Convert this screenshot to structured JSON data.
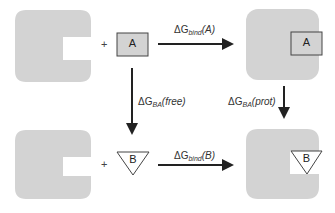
{
  "diagram": {
    "type": "thermodynamic-cycle",
    "nodes": {
      "top_left": {
        "protein": "free protein (with binding pocket)",
        "ligand": "A",
        "ligand_shape": "square"
      },
      "top_right": {
        "complex": "protein bound to A",
        "ligand": "A"
      },
      "bottom_left": {
        "protein": "free protein (with binding pocket)",
        "ligand": "B",
        "ligand_shape": "triangle"
      },
      "bottom_right": {
        "complex": "protein bound to B",
        "ligand": "B"
      }
    },
    "plus_sign": "+",
    "edges": [
      {
        "from": "top_left",
        "to": "top_right",
        "delta": "ΔG",
        "sub": "bind",
        "arg": "(A)"
      },
      {
        "from": "top_left",
        "to": "bottom_left",
        "delta": "ΔG",
        "sub": "BA",
        "arg": "(free)"
      },
      {
        "from": "top_right",
        "to": "bottom_right",
        "delta": "ΔG",
        "sub": "BA",
        "arg": "(prot)"
      },
      {
        "from": "bottom_left",
        "to": "bottom_right",
        "delta": "ΔG",
        "sub": "bind",
        "arg": "(B)"
      }
    ],
    "colors": {
      "protein": "#d3d3d3",
      "ligand_fill": "#d3d3d3",
      "stroke": "#333333",
      "arrow": "#222222"
    }
  }
}
